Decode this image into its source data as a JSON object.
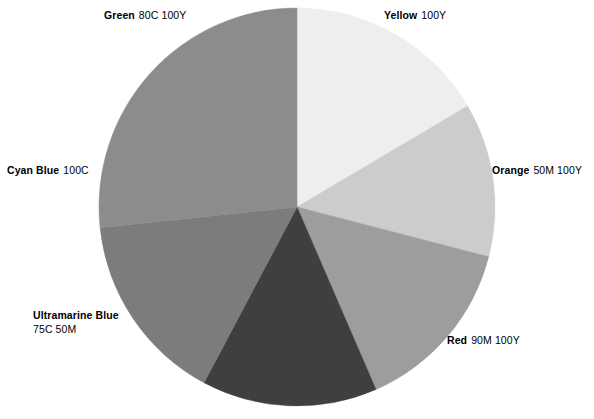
{
  "figure": {
    "background": "#ffffff",
    "width": 594,
    "height": 419
  },
  "chart_data": {
    "type": "pie",
    "title": "",
    "subtitle": "",
    "xlabel": "",
    "ylabel": "",
    "legend_position": "around-slices",
    "grid": false,
    "center": {
      "x": 297,
      "y": 207
    },
    "radius": {
      "x": 198,
      "y": 199
    },
    "start_angle_deg": 0,
    "direction": "clockwise",
    "categories": [
      "Yellow",
      "Orange",
      "Red",
      "Ultramarine Blue",
      "Cyan Blue",
      "Green"
    ],
    "values": [
      16.5,
      12.5,
      14.5,
      14.5,
      15.5,
      26.5
    ],
    "labels": [
      "Yellow  100Y",
      "Orange  50M 100Y",
      "Red  90M 100Y",
      "Ultramarine Blue 75C 50M",
      "Cyan Blue  100C",
      "Green  80C 100Y"
    ],
    "colors": [
      "#eeeeee",
      "#cccccc",
      "#9d9d9d",
      "#3f3f3f",
      "#7c7c7c",
      "#8c8c8c"
    ],
    "slices": [
      {
        "id": "yellow",
        "name": "Yellow",
        "spec": "100Y",
        "color": "#eeeeee",
        "start_deg": 0,
        "end_deg": 59.5,
        "percent": 16.5
      },
      {
        "id": "orange",
        "name": "Orange",
        "spec": "50M 100Y",
        "color": "#cccccc",
        "start_deg": 59.5,
        "end_deg": 104.5,
        "percent": 12.5
      },
      {
        "id": "red",
        "name": "Red",
        "spec": "90M 100Y",
        "color": "#9d9d9d",
        "start_deg": 104.5,
        "end_deg": 156.5,
        "percent": 14.5
      },
      {
        "id": "ultramarine-blue",
        "name": "Ultramarine Blue",
        "spec": "75C 50M",
        "color": "#3f3f3f",
        "start_deg": 156.5,
        "end_deg": 208.0,
        "percent": 14.5
      },
      {
        "id": "cyan-blue",
        "name": "Cyan Blue",
        "spec": "100C",
        "color": "#7c7c7c",
        "start_deg": 208.0,
        "end_deg": 264.0,
        "percent": 15.5
      },
      {
        "id": "green",
        "name": "Green",
        "spec": "80C 100Y",
        "color": "#8c8c8c",
        "start_deg": 264.0,
        "end_deg": 360.0,
        "percent": 26.5
      }
    ]
  },
  "labels": {
    "green": {
      "name": "Green",
      "spec": "80C 100Y"
    },
    "yellow": {
      "name": "Yellow",
      "spec": "100Y"
    },
    "orange": {
      "name": "Orange",
      "spec": "50M 100Y"
    },
    "cyan": {
      "name": "Cyan Blue",
      "spec": "100C"
    },
    "ultramarine": {
      "name": "Ultramarine Blue",
      "spec": "75C 50M"
    },
    "red": {
      "name": "Red",
      "spec": "90M 100Y"
    }
  }
}
